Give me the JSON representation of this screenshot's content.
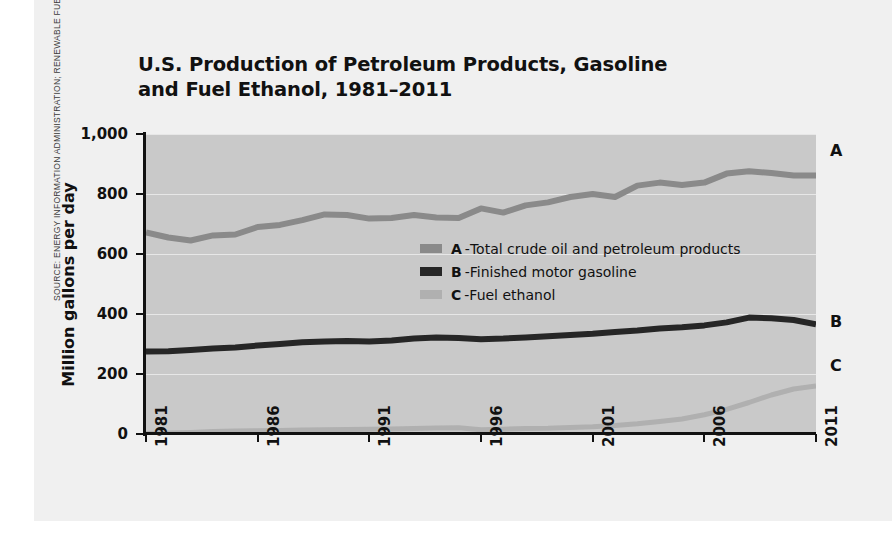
{
  "source_credit": "SOURCE: ENERGY INFORMATION ADMINISTRATION; RENEWABLE FUELS ASSOCIATION",
  "title_line1": "U.S. Production of Petroleum Products, Gasoline",
  "title_line2": "and Fuel Ethanol, 1981–2011",
  "legend": [
    {
      "key": "A",
      "dash": "-",
      "label": "Total crude oil and petroleum products",
      "color": "#8a8a8a"
    },
    {
      "key": "B",
      "dash": "-",
      "label": "Finished motor gasoline",
      "color": "#262626"
    },
    {
      "key": "C",
      "dash": "-",
      "label": "Fuel ethanol",
      "color": "#b0b0b0"
    }
  ],
  "end_labels": {
    "a": "A",
    "b": "B",
    "c": "C"
  },
  "colors": {
    "plot_background": "#c9c9c9",
    "panel_background": "#f0f0f0",
    "axis": "#111111",
    "series_a": "#8a8a8a",
    "series_b": "#262626",
    "series_c": "#b0b0b0"
  },
  "chart_data": {
    "type": "line",
    "title": "U.S. Production of Petroleum Products, Gasoline and Fuel Ethanol, 1981–2011",
    "xlabel": "",
    "ylabel": "Million gallons per day",
    "xlim": [
      1981,
      2011
    ],
    "ylim": [
      0,
      1000
    ],
    "yticks": [
      0,
      200,
      400,
      600,
      800,
      1000
    ],
    "ytick_labels": [
      "0",
      "200",
      "400",
      "600",
      "800",
      "1,000"
    ],
    "xticks": [
      1981,
      1986,
      1991,
      1996,
      2001,
      2006,
      2011
    ],
    "xtick_labels": [
      "1981",
      "1986",
      "1991",
      "1996",
      "2001",
      "2006",
      "2011"
    ],
    "grid": "horizontal",
    "legend_position": "center",
    "x": [
      1981,
      1982,
      1983,
      1984,
      1985,
      1986,
      1987,
      1988,
      1989,
      1990,
      1991,
      1992,
      1993,
      1994,
      1995,
      1996,
      1997,
      1998,
      1999,
      2000,
      2001,
      2002,
      2003,
      2004,
      2005,
      2006,
      2007,
      2008,
      2009,
      2010,
      2011
    ],
    "series": [
      {
        "name": "Total crude oil and petroleum products",
        "key": "A",
        "color": "#8a8a8a",
        "values": [
          672,
          655,
          645,
          662,
          665,
          690,
          697,
          713,
          732,
          730,
          718,
          720,
          730,
          722,
          720,
          752,
          738,
          762,
          772,
          790,
          800,
          790,
          828,
          838,
          830,
          838,
          868,
          876,
          870,
          862,
          862
        ]
      },
      {
        "name": "Finished motor gasoline",
        "key": "B",
        "color": "#262626",
        "values": [
          275,
          276,
          280,
          285,
          288,
          295,
          300,
          306,
          308,
          310,
          308,
          312,
          318,
          322,
          320,
          316,
          318,
          322,
          326,
          330,
          334,
          340,
          345,
          352,
          356,
          362,
          372,
          388,
          386,
          380,
          366
        ]
      },
      {
        "name": "Fuel ethanol",
        "key": "C",
        "color": "#b0b0b0",
        "values": [
          2,
          3,
          5,
          8,
          10,
          11,
          12,
          13,
          14,
          15,
          16,
          17,
          18,
          20,
          21,
          14,
          16,
          18,
          19,
          22,
          24,
          28,
          34,
          42,
          50,
          64,
          82,
          105,
          130,
          150,
          160
        ]
      }
    ],
    "series_a_late": [
      868,
      876,
      870,
      800,
      778,
      820,
      785
    ]
  }
}
